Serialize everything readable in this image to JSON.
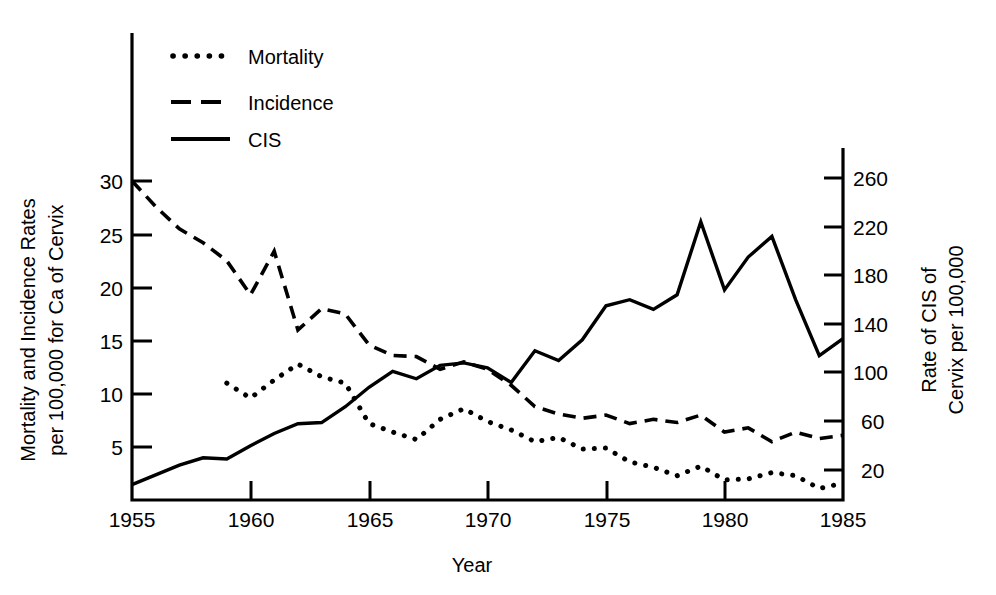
{
  "chart_data": {
    "type": "line",
    "title": "",
    "xlabel": "Year",
    "ylabel_left": "Mortality and Incidence Rates per 100,000 for Ca of Cervix",
    "ylabel_left_line1": "Mortality and Incidence Rates",
    "ylabel_left_line2": "per 100,000 for Ca of Cervix",
    "ylabel_right": "Rate of CIS of Cervix per 100,000",
    "ylabel_right_line1": "Rate of CIS of",
    "ylabel_right_line2": "Cervix per 100,000",
    "grid": false,
    "legend_position": "top-left",
    "xlim": [
      1955,
      1985
    ],
    "xticks": [
      1955,
      1960,
      1965,
      1970,
      1975,
      1980,
      1985
    ],
    "xticklabels": [
      "1955",
      "1960",
      "1965",
      "1970",
      "1975",
      "1980",
      "1985"
    ],
    "ylim_left": [
      0,
      31.5
    ],
    "yticks_left": [
      5,
      10,
      15,
      20,
      25,
      30
    ],
    "yticklabels_left": [
      "5",
      "10",
      "15",
      "20",
      "25",
      "30"
    ],
    "ylim_right": [
      0,
      268
    ],
    "yticks_right": [
      20,
      60,
      100,
      140,
      180,
      220,
      260
    ],
    "yticklabels_right": [
      "20",
      "60",
      "100",
      "140",
      "180",
      "220",
      "260"
    ],
    "series": [
      {
        "name": "Mortality",
        "style": "dotted",
        "axis": "left",
        "x": [
          1959,
          1960,
          1961,
          1962,
          1963,
          1964,
          1965,
          1966,
          1967,
          1968,
          1969,
          1970,
          1971,
          1972,
          1973,
          1974,
          1975,
          1976,
          1977,
          1978,
          1979,
          1980,
          1981,
          1982,
          1983,
          1984,
          1985
        ],
        "values": [
          11.0,
          9.6,
          11.3,
          12.8,
          11.6,
          11.0,
          7.2,
          6.4,
          5.7,
          7.6,
          8.6,
          7.4,
          6.6,
          5.5,
          5.9,
          4.8,
          4.9,
          3.6,
          3.1,
          2.3,
          3.2,
          1.9,
          2.0,
          2.6,
          2.3,
          1.1,
          1.6
        ]
      },
      {
        "name": "Incidence",
        "style": "dashed",
        "axis": "left",
        "x": [
          1955,
          1956,
          1957,
          1958,
          1959,
          1960,
          1961,
          1962,
          1963,
          1964,
          1965,
          1966,
          1967,
          1968,
          1969,
          1970,
          1971,
          1972,
          1973,
          1974,
          1975,
          1976,
          1977,
          1978,
          1979,
          1980,
          1981,
          1982,
          1983,
          1984,
          1985
        ],
        "values": [
          30.0,
          27.6,
          25.5,
          24.2,
          22.5,
          19.3,
          23.4,
          16.0,
          18.0,
          17.5,
          14.6,
          13.6,
          13.5,
          12.3,
          13.0,
          12.3,
          10.8,
          8.8,
          8.1,
          7.7,
          8.0,
          7.2,
          7.6,
          7.3,
          8.0,
          6.4,
          6.8,
          5.5,
          6.4,
          5.8,
          6.1
        ]
      },
      {
        "name": "CIS",
        "style": "solid",
        "axis": "right",
        "x": [
          1955,
          1956,
          1957,
          1958,
          1959,
          1960,
          1961,
          1962,
          1963,
          1964,
          1965,
          1966,
          1967,
          1968,
          1969,
          1970,
          1971,
          1972,
          1973,
          1974,
          1975,
          1976,
          1977,
          1978,
          1979,
          1980,
          1981,
          1982,
          1983,
          1984,
          1985
        ],
        "values": [
          8,
          16,
          24,
          30,
          29,
          40,
          50,
          58,
          59,
          72,
          88,
          101,
          95,
          106,
          108,
          104,
          92,
          118,
          110,
          127,
          155,
          160,
          152,
          164,
          224,
          168,
          195,
          212,
          160,
          114,
          128
        ]
      }
    ],
    "legend": [
      {
        "label": "Mortality",
        "style": "dotted"
      },
      {
        "label": "Incidence",
        "style": "dashed"
      },
      {
        "label": "CIS",
        "style": "solid"
      }
    ]
  }
}
